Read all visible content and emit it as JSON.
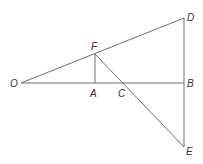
{
  "diagram": {
    "points": {
      "O": {
        "label": "O",
        "x": 21,
        "y": 83
      },
      "F": {
        "label": "F",
        "x": 95,
        "y": 54
      },
      "A": {
        "label": "A",
        "x": 95,
        "y": 83
      },
      "C": {
        "label": "C",
        "x": 123,
        "y": 83
      },
      "B": {
        "label": "B",
        "x": 184,
        "y": 83
      },
      "D": {
        "label": "D",
        "x": 184,
        "y": 18
      },
      "E": {
        "label": "E",
        "x": 184,
        "y": 147
      }
    },
    "segments": [
      [
        "O",
        "D"
      ],
      [
        "O",
        "B"
      ],
      [
        "F",
        "A"
      ],
      [
        "F",
        "E"
      ],
      [
        "D",
        "E"
      ]
    ],
    "colors": {
      "line": "#6f6f6f",
      "label": "#333333",
      "background": "#ffffff"
    }
  }
}
